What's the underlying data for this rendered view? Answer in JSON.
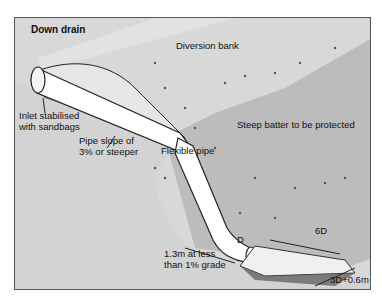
{
  "diagram": {
    "title": "Down drain",
    "labels": {
      "diversion_bank": "Diversion bank",
      "inlet_line1": "Inlet stabilised",
      "inlet_line2": "with sandbags",
      "pipe_slope_line1": "Pipe slope of",
      "pipe_slope_line2": "3% or steeper",
      "flexible_pipe": "Flexible pipe",
      "steep_batter": "Steep batter to be protected",
      "outlet_length_line1": "1.3m at less",
      "outlet_length_line2": "than 1% grade",
      "pipe_diameter": "D",
      "apron_length": "6D",
      "apron_width": "3D+0.6m"
    },
    "colors": {
      "ground": "#d6d6d6",
      "batter": "#bdbdbd",
      "bank": "#cfcfcf",
      "pipe": "#ffffff",
      "outline": "#1a1a1a"
    }
  }
}
